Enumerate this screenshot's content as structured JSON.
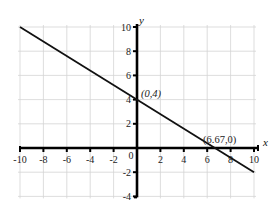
{
  "chart_data": {
    "type": "line",
    "title": "",
    "xlabel": "x",
    "ylabel": "y",
    "xlim": [
      -10,
      10
    ],
    "ylim": [
      -4,
      10
    ],
    "grid": true,
    "grid_step": 2,
    "x_ticks": [
      -10,
      -8,
      -6,
      -4,
      -2,
      0,
      2,
      4,
      6,
      8,
      10
    ],
    "y_ticks": [
      -4,
      -2,
      2,
      4,
      6,
      8,
      10
    ],
    "x_tick_labels": [
      "-10",
      "-8",
      "-6",
      "-4",
      "-2",
      "0",
      "2",
      "4",
      "6",
      "8",
      "10"
    ],
    "y_tick_labels": [
      "-4",
      "-2",
      "2",
      "4",
      "6",
      "8",
      "10"
    ],
    "series": [
      {
        "name": "y = -0.6x + 4",
        "x": [
          -10,
          10
        ],
        "y": [
          10,
          -2
        ]
      }
    ],
    "annotations": [
      {
        "text": "(0,4)",
        "x": 0,
        "y": 4
      },
      {
        "text": "(6.67,0)",
        "x": 6.67,
        "y": 0
      }
    ],
    "legend": null
  },
  "colors": {
    "line": "#111111",
    "axis": "#000000",
    "grid": "#d4d4d4",
    "background": "#ffffff"
  }
}
